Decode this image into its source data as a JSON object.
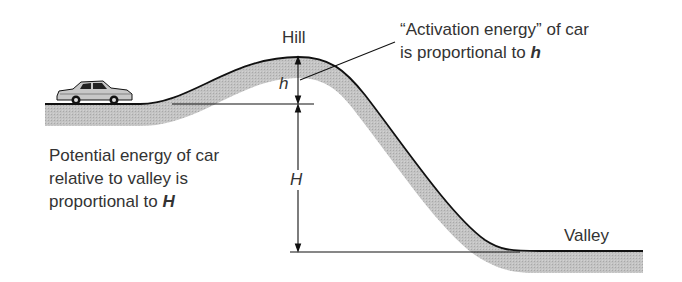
{
  "labels": {
    "hill": "Hill",
    "valley": "Valley",
    "h_symbol": "h",
    "H_symbol": "H",
    "activation_line1": "“Activation energy” of car",
    "activation_line2_prefix": "is proportional to ",
    "activation_line2_symbol": "h",
    "potential_line1": "Potential energy of car",
    "potential_line2": "relative to valley is",
    "potential_line3_prefix": "proportional to ",
    "potential_line3_symbol": "H"
  },
  "colors": {
    "ground_fill": "#bdbdbd",
    "line": "#111111",
    "text": "#333333",
    "car_body": "#c8c8c8"
  }
}
